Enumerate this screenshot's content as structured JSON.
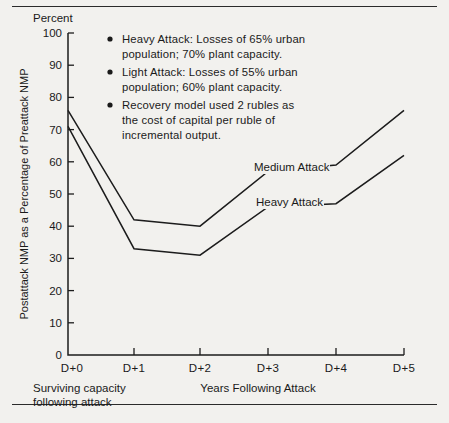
{
  "chart_data": {
    "type": "line",
    "title": "",
    "xlabel": "Years Following Attack",
    "ylabel": "Postattack NMP as a Percentage of Preattack NMP",
    "yunit": "Percent",
    "categories": [
      "D+0",
      "D+1",
      "D+2",
      "D+3",
      "D+4",
      "D+5"
    ],
    "ylim": [
      0,
      100
    ],
    "yticks": [
      0,
      10,
      20,
      30,
      40,
      50,
      60,
      70,
      80,
      90,
      100
    ],
    "grid": false,
    "legend_position": "inline-labels",
    "series": [
      {
        "name": "Medium Attack",
        "values": [
          76,
          42,
          40,
          57,
          59,
          76
        ]
      },
      {
        "name": "Heavy Attack",
        "values": [
          71,
          33,
          31,
          46,
          47,
          62
        ]
      }
    ],
    "annotations": [
      "Heavy Attack:  Losses of 65% urban population; 70% plant capacity.",
      "Light Attack:  Losses of 55% urban population; 60% plant capacity.",
      "Recovery model used 2 rubles as the cost of capital per ruble of incremental output."
    ]
  },
  "axis": {
    "y_unit_label": "Percent",
    "y_title": "Postattack NMP as a Percentage of Preattack NMP",
    "x_title": "Years Following Attack",
    "y_tick_labels": [
      "100",
      "90",
      "80",
      "70",
      "60",
      "50",
      "40",
      "30",
      "20",
      "10",
      "0"
    ],
    "x_tick_labels": [
      "D+0",
      "D+1",
      "D+2",
      "D+3",
      "D+4",
      "D+5"
    ]
  },
  "caption": {
    "line1": "Surviving capacity",
    "line2": "following attack"
  },
  "series_labels": {
    "medium": "Medium Attack",
    "heavy": "Heavy Attack"
  },
  "legend": {
    "items": [
      {
        "line1": "Heavy Attack:  Losses of 65% urban",
        "line2": "population; 70% plant capacity."
      },
      {
        "line1": "Light Attack:  Losses of 55% urban",
        "line2": "population; 60% plant capacity."
      },
      {
        "line1": "Recovery model used 2 rubles as",
        "line2": "the cost of capital per ruble of",
        "line3": "incremental output."
      }
    ]
  },
  "colors": {
    "ink": "#1a1a1a",
    "paper": "#f2f1ee"
  }
}
